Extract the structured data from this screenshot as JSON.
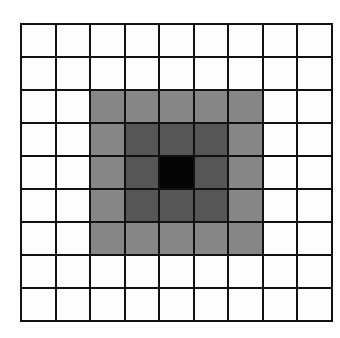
{
  "diagram": {
    "type": "grid-kernel",
    "rows": 9,
    "cols": 9,
    "colors": {
      "0": "#fdfdfd",
      "1": "#868686",
      "2": "#565656",
      "3": "#050505",
      "lines": "#111111"
    },
    "cells": [
      [
        0,
        0,
        0,
        0,
        0,
        0,
        0,
        0,
        0
      ],
      [
        0,
        0,
        0,
        0,
        0,
        0,
        0,
        0,
        0
      ],
      [
        0,
        0,
        1,
        1,
        1,
        1,
        1,
        0,
        0
      ],
      [
        0,
        0,
        1,
        2,
        2,
        2,
        1,
        0,
        0
      ],
      [
        0,
        0,
        1,
        2,
        3,
        2,
        1,
        0,
        0
      ],
      [
        0,
        0,
        1,
        2,
        2,
        2,
        1,
        0,
        0
      ],
      [
        0,
        0,
        1,
        1,
        1,
        1,
        1,
        0,
        0
      ],
      [
        0,
        0,
        0,
        0,
        0,
        0,
        0,
        0,
        0
      ],
      [
        0,
        0,
        0,
        0,
        0,
        0,
        0,
        0,
        0
      ]
    ]
  }
}
